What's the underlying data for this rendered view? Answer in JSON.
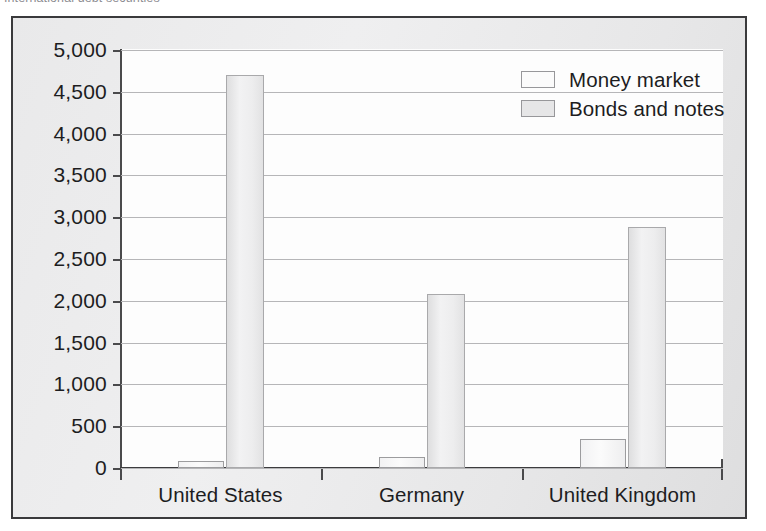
{
  "caption": {
    "text": "International debt securities"
  },
  "chart_data": {
    "type": "bar",
    "title": "",
    "subtitle": "",
    "xlabel": "",
    "ylabel": "",
    "categories": [
      "United States",
      "Germany",
      "United Kingdom"
    ],
    "series": [
      {
        "name": "Money market",
        "values": [
          80,
          130,
          350
        ],
        "color": "#fbfbfb"
      },
      {
        "name": "Bonds and notes",
        "values": [
          4700,
          2080,
          2880
        ],
        "color": "#e6e6e7"
      }
    ],
    "ylim": [
      0,
      5000
    ],
    "ytick_values": [
      0,
      500,
      1000,
      1500,
      2000,
      2500,
      3000,
      3500,
      4000,
      4500,
      5000
    ],
    "ytick_labels": [
      "0",
      "500",
      "1,000",
      "1,500",
      "2,000",
      "2,500",
      "3,000",
      "3,500",
      "4,000",
      "4,500",
      "5,000"
    ],
    "grid": true,
    "grid_axis": "y",
    "legend_position": "top-right",
    "legend_entries": [
      "Money market",
      "Bonds and notes"
    ]
  },
  "colors": {
    "frame_border": "#3a3a3c",
    "paper_background": "#ececed",
    "plot_background": "#fdfdfd",
    "gridline": "#b6b6b8",
    "axis": "#4a4a4c",
    "text": "#1d1d1f"
  }
}
